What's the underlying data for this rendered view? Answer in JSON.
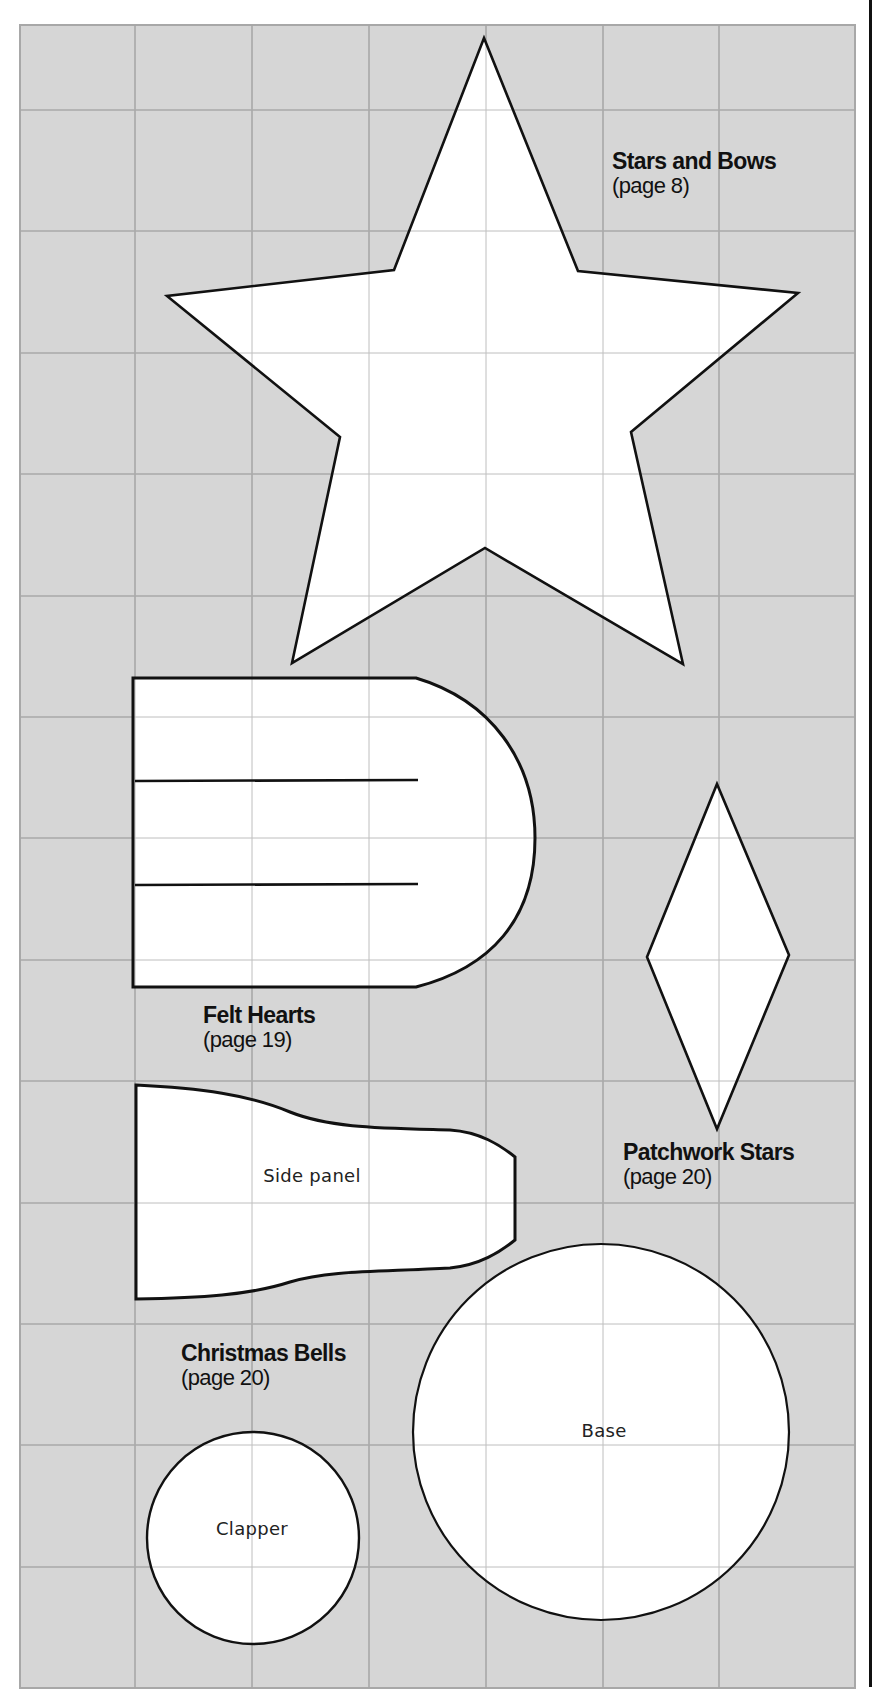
{
  "colors": {
    "grid_background": "#d6d6d6",
    "grid_lines": "#9a9a9a",
    "pattern_fill": "#ffffff",
    "pattern_outline": "#111111",
    "text": "#111111"
  },
  "grid": {
    "left": 20,
    "right": 855,
    "top": 25,
    "bottom": 1688,
    "vertical_lines": [
      135,
      252,
      369,
      486,
      603,
      719
    ],
    "horizontal_lines": [
      110,
      231,
      353,
      474,
      596,
      717,
      838,
      960,
      1081,
      1203,
      1324,
      1445,
      1567
    ]
  },
  "patterns": [
    {
      "id": "stars-and-bows",
      "title": "Stars and Bows",
      "page": "(page 8)",
      "shape": "five-point-star"
    },
    {
      "id": "felt-hearts",
      "title": "Felt Hearts",
      "page": "(page 19)",
      "shape": "rounded-rectangle-with-slits"
    },
    {
      "id": "patchwork-stars",
      "title": "Patchwork Stars",
      "page": "(page 20)",
      "shape": "diamond"
    },
    {
      "id": "christmas-bells",
      "title": "Christmas Bells",
      "page": "(page 20)",
      "pieces": [
        {
          "label": "Side panel",
          "shape": "bell-side-panel"
        },
        {
          "label": "Base",
          "shape": "circle"
        },
        {
          "label": "Clapper",
          "shape": "circle"
        }
      ]
    }
  ]
}
